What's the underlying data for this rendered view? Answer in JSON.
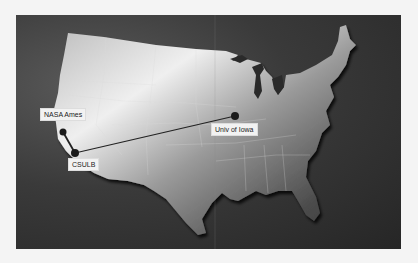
{
  "map": {
    "title": "",
    "region": "Contiguous United States",
    "colors": {
      "background": "#2a2a2a",
      "land_light": "#e8e8e8",
      "land_dark": "#3c3c3c",
      "marker": "#1a1a1a",
      "route": "#222222",
      "label_bg": "#f2f2f2"
    },
    "locations": [
      {
        "id": "nasa-ames",
        "label": "NASA Ames"
      },
      {
        "id": "csulb",
        "label": "CSULB"
      },
      {
        "id": "univ-of-iowa",
        "label": "Univ of Iowa"
      }
    ],
    "routes": [
      {
        "from": "nasa-ames",
        "to": "csulb"
      },
      {
        "from": "csulb",
        "to": "univ-of-iowa"
      }
    ]
  }
}
